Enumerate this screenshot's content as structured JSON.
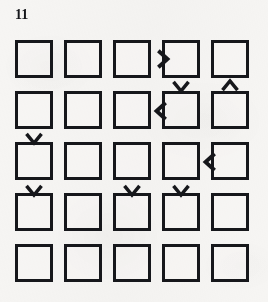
{
  "page": {
    "label": "11",
    "background_color": "#f6f5f3",
    "ink_color": "#16171b",
    "width": 268,
    "height": 302
  },
  "grid": {
    "rows": 5,
    "columns": 5,
    "cell_size": 38,
    "cell_border_px": 3,
    "origin_x": 15,
    "origin_y": 40,
    "step_x": 49,
    "step_y": 51,
    "cells": [
      [
        {
          "row": 1,
          "col": 1
        },
        {
          "row": 1,
          "col": 2
        },
        {
          "row": 1,
          "col": 3
        },
        {
          "row": 1,
          "col": 4
        },
        {
          "row": 1,
          "col": 5
        }
      ],
      [
        {
          "row": 2,
          "col": 1
        },
        {
          "row": 2,
          "col": 2
        },
        {
          "row": 2,
          "col": 3
        },
        {
          "row": 2,
          "col": 4
        },
        {
          "row": 2,
          "col": 5
        }
      ],
      [
        {
          "row": 3,
          "col": 1
        },
        {
          "row": 3,
          "col": 2
        },
        {
          "row": 3,
          "col": 3
        },
        {
          "row": 3,
          "col": 4
        },
        {
          "row": 3,
          "col": 5
        }
      ],
      [
        {
          "row": 4,
          "col": 1
        },
        {
          "row": 4,
          "col": 2
        },
        {
          "row": 4,
          "col": 3
        },
        {
          "row": 4,
          "col": 4
        },
        {
          "row": 4,
          "col": 5
        }
      ],
      [
        {
          "row": 5,
          "col": 1
        },
        {
          "row": 5,
          "col": 2
        },
        {
          "row": 5,
          "col": 3
        },
        {
          "row": 5,
          "col": 4
        },
        {
          "row": 5,
          "col": 5
        }
      ]
    ]
  },
  "arrows": [
    {
      "id": "arrow-right-r1-c3-c4",
      "glyph": ">",
      "direction": "right",
      "icon": "chevron-right-icon",
      "row": 1,
      "between_columns": [
        3,
        4
      ],
      "x": 151,
      "y": 48,
      "size": 22
    },
    {
      "id": "arrow-down-r1-c4",
      "glyph": "v",
      "direction": "down",
      "icon": "chevron-down-icon",
      "below_row": 1,
      "column": 4,
      "x": 171,
      "y": 76,
      "size": 20
    },
    {
      "id": "arrow-up-r1-c5",
      "glyph": "^",
      "direction": "up",
      "icon": "chevron-up-icon",
      "below_row": 1,
      "column": 5,
      "x": 220,
      "y": 76,
      "size": 20
    },
    {
      "id": "arrow-left-r2-c3-c4",
      "glyph": "<",
      "direction": "left",
      "icon": "chevron-left-icon",
      "row": 2,
      "between_columns": [
        3,
        4
      ],
      "x": 151,
      "y": 100,
      "size": 22
    },
    {
      "id": "arrow-down-r2-c1",
      "glyph": "v",
      "direction": "down",
      "icon": "chevron-down-icon",
      "below_row": 2,
      "column": 1,
      "x": 24,
      "y": 128,
      "size": 20
    },
    {
      "id": "arrow-left-r3-c4-c5",
      "glyph": "<",
      "direction": "left",
      "icon": "chevron-left-icon",
      "row": 3,
      "between_columns": [
        4,
        5
      ],
      "x": 200,
      "y": 151,
      "size": 22
    },
    {
      "id": "arrow-down-r3-c1",
      "glyph": "v",
      "direction": "down",
      "icon": "chevron-down-icon",
      "below_row": 3,
      "column": 1,
      "x": 24,
      "y": 180,
      "size": 20
    },
    {
      "id": "arrow-down-r3-c3",
      "glyph": "v",
      "direction": "down",
      "icon": "chevron-down-icon",
      "below_row": 3,
      "column": 3,
      "x": 122,
      "y": 180,
      "size": 20
    },
    {
      "id": "arrow-down-r3-c4",
      "glyph": "v",
      "direction": "down",
      "icon": "chevron-down-icon",
      "below_row": 3,
      "column": 4,
      "x": 171,
      "y": 180,
      "size": 20
    }
  ]
}
